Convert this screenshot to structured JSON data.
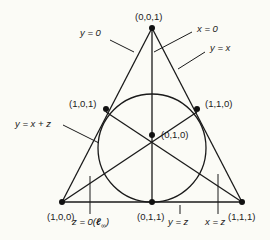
{
  "figure": {
    "points": [
      {
        "id": "p001",
        "label": "(0,0,1)"
      },
      {
        "id": "p100",
        "label": "(1,0,0)"
      },
      {
        "id": "p111",
        "label": "(1,1,1)"
      },
      {
        "id": "p011",
        "label": "(0,1,1)"
      },
      {
        "id": "p010",
        "label": "(0,1,0)"
      },
      {
        "id": "p101",
        "label": "(1,0,1)"
      },
      {
        "id": "p110",
        "label": "(1,1,0)"
      }
    ],
    "lines": [
      {
        "id": "y0",
        "label": "y = 0"
      },
      {
        "id": "x0",
        "label": "x = 0"
      },
      {
        "id": "yx",
        "label": "y = x"
      },
      {
        "id": "yxz",
        "label": "y = x + z"
      },
      {
        "id": "z0",
        "label": "z = 0(",
        "sub_symbol": "ℓ",
        "subscript": "∞",
        "close": ")"
      },
      {
        "id": "yz",
        "label": "y = z"
      },
      {
        "id": "xz",
        "label": "x = z"
      }
    ]
  }
}
